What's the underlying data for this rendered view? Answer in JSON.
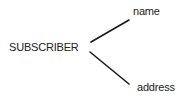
{
  "diagram": {
    "type": "entity-attribute",
    "entity": {
      "label": "SUBSCRIBER"
    },
    "attributes": [
      {
        "label": "name"
      },
      {
        "label": "address"
      }
    ],
    "edges": [
      {
        "from": "SUBSCRIBER",
        "to": "name"
      },
      {
        "from": "SUBSCRIBER",
        "to": "address"
      }
    ],
    "colors": {
      "text": "#222222",
      "line": "#1a1a1a",
      "background": "#ffffff"
    }
  }
}
